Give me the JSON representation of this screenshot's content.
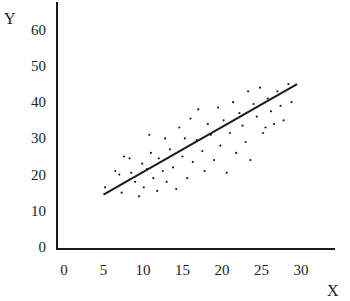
{
  "chart_data": {
    "type": "scatter",
    "title": "",
    "xlabel": "X",
    "ylabel": "Y",
    "xlim": [
      0,
      33
    ],
    "ylim": [
      0,
      65
    ],
    "grid": false,
    "legend": null,
    "x_ticks": [
      0,
      5,
      10,
      15,
      20,
      25,
      30
    ],
    "y_ticks": [
      0,
      10,
      20,
      30,
      40,
      50,
      60
    ],
    "series": [
      {
        "name": "observations",
        "style": "dots",
        "points": [
          [
            5.2,
            16.5
          ],
          [
            6.5,
            21
          ],
          [
            7.0,
            20
          ],
          [
            7.3,
            15
          ],
          [
            7.6,
            25
          ],
          [
            8.3,
            24.5
          ],
          [
            8.5,
            20.5
          ],
          [
            9.0,
            18
          ],
          [
            9.5,
            14
          ],
          [
            9.9,
            23
          ],
          [
            10.1,
            16.5
          ],
          [
            10.5,
            21.5
          ],
          [
            10.8,
            31
          ],
          [
            11.0,
            26
          ],
          [
            11.3,
            19
          ],
          [
            11.8,
            15.5
          ],
          [
            12.0,
            24.5
          ],
          [
            12.5,
            21
          ],
          [
            12.8,
            30
          ],
          [
            13.0,
            18
          ],
          [
            13.4,
            27
          ],
          [
            13.8,
            22
          ],
          [
            14.2,
            16
          ],
          [
            14.6,
            33
          ],
          [
            15.0,
            25
          ],
          [
            15.3,
            30
          ],
          [
            15.6,
            19
          ],
          [
            16.0,
            35.5
          ],
          [
            16.3,
            23.5
          ],
          [
            16.8,
            29.5
          ],
          [
            17.0,
            38
          ],
          [
            17.5,
            26.5
          ],
          [
            17.8,
            21
          ],
          [
            18.2,
            34
          ],
          [
            18.6,
            31
          ],
          [
            19.0,
            24
          ],
          [
            19.5,
            38.5
          ],
          [
            19.8,
            28
          ],
          [
            20.2,
            35
          ],
          [
            20.6,
            20.5
          ],
          [
            21.0,
            31.5
          ],
          [
            21.4,
            40
          ],
          [
            21.8,
            26
          ],
          [
            22.2,
            37
          ],
          [
            22.6,
            33.5
          ],
          [
            23.0,
            29
          ],
          [
            23.3,
            43
          ],
          [
            23.6,
            24
          ],
          [
            24.0,
            39.5
          ],
          [
            24.4,
            36
          ],
          [
            24.8,
            44
          ],
          [
            25.2,
            31.5
          ],
          [
            25.5,
            33
          ],
          [
            25.8,
            41
          ],
          [
            26.2,
            37.5
          ],
          [
            26.6,
            34
          ],
          [
            27.0,
            43
          ],
          [
            27.4,
            39
          ],
          [
            27.8,
            35
          ],
          [
            28.4,
            45
          ],
          [
            28.8,
            40
          ]
        ]
      },
      {
        "name": "regression line",
        "style": "line",
        "points": [
          [
            5,
            14.5
          ],
          [
            29.5,
            45
          ]
        ]
      }
    ]
  },
  "labels": {
    "x_axis": "X",
    "y_axis": "Y"
  }
}
